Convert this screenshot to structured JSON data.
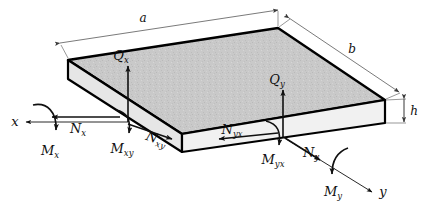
{
  "figure": {
    "colors": {
      "top_face": "#c9c9c9",
      "front_face": "#efefef",
      "left_face": "#e4e4e4",
      "outline": "#000000",
      "dimension_line": "#6b6b6b",
      "label": "#101010",
      "background": "#ffffff"
    },
    "dimensions": [
      {
        "name": "plate-length-a",
        "symbol": "a",
        "sub": ""
      },
      {
        "name": "plate-width-b",
        "symbol": "b",
        "sub": ""
      },
      {
        "name": "plate-thickness-h",
        "symbol": "h",
        "sub": ""
      }
    ],
    "axes": [
      {
        "name": "axis-x",
        "symbol": "x",
        "sub": ""
      },
      {
        "name": "axis-y",
        "symbol": "y",
        "sub": ""
      }
    ],
    "shear_forces": [
      {
        "name": "shear-force-qx",
        "symbol": "Q",
        "sub": "x"
      },
      {
        "name": "shear-force-qy",
        "symbol": "Q",
        "sub": "y"
      }
    ],
    "in_plane_forces": [
      {
        "name": "normal-force-nx",
        "symbol": "N",
        "sub": "x"
      },
      {
        "name": "shear-flow-nxy",
        "symbol": "N",
        "sub": "xy"
      },
      {
        "name": "shear-flow-nyx",
        "symbol": "N",
        "sub": "yx"
      },
      {
        "name": "normal-force-ny",
        "symbol": "N",
        "sub": "y"
      }
    ],
    "moments": [
      {
        "name": "bending-moment-mx",
        "symbol": "M",
        "sub": "x"
      },
      {
        "name": "twisting-moment-mxy",
        "symbol": "M",
        "sub": "xy"
      },
      {
        "name": "twisting-moment-myx",
        "symbol": "M",
        "sub": "yx"
      },
      {
        "name": "bending-moment-my",
        "symbol": "M",
        "sub": "y"
      }
    ]
  }
}
